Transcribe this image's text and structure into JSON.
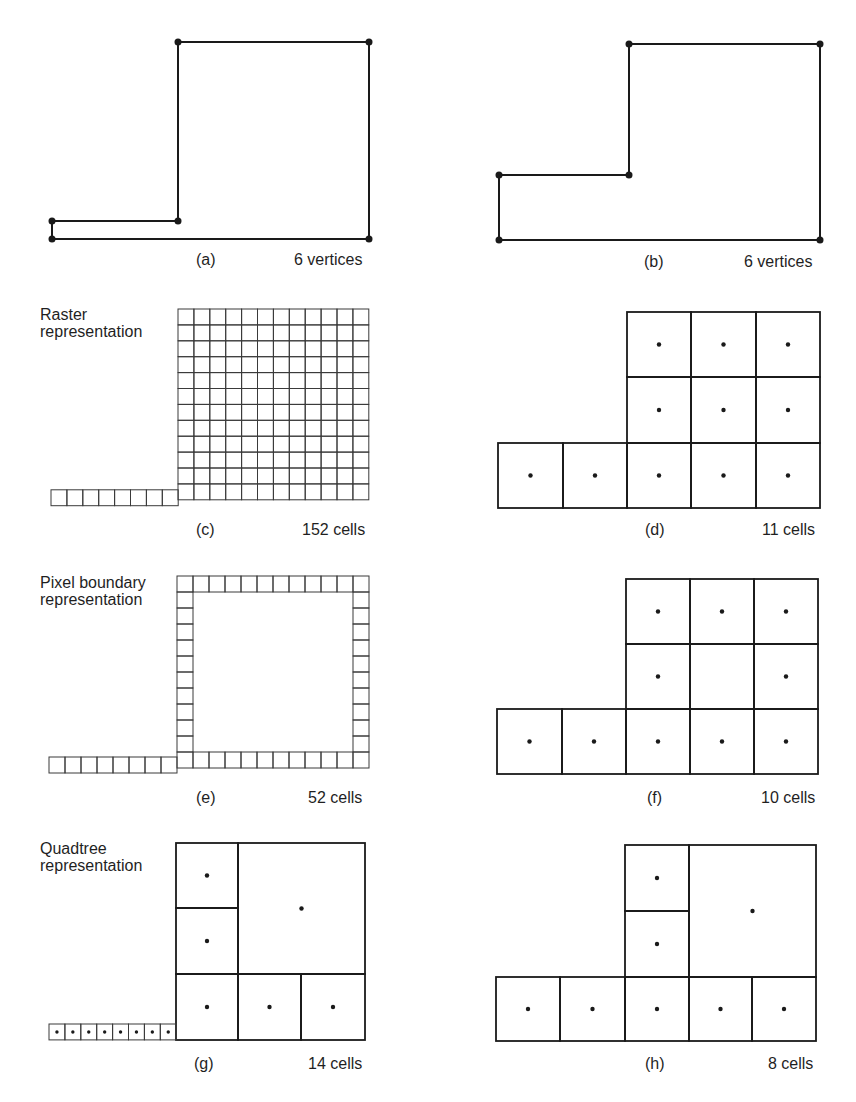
{
  "figure": {
    "panels": [
      {
        "id": "a",
        "caption": "(a)",
        "count_label": "6 vertices",
        "kind": "vector",
        "caption_pos": [
          196,
          252
        ],
        "count_pos": [
          294,
          252
        ],
        "vertices": [
          [
            52,
            221
          ],
          [
            178,
            221
          ],
          [
            178,
            42
          ],
          [
            369,
            42
          ],
          [
            369,
            239
          ],
          [
            52,
            239
          ]
        ]
      },
      {
        "id": "b",
        "caption": "(b)",
        "count_label": "6 vertices",
        "kind": "vector",
        "caption_pos": [
          644,
          254
        ],
        "count_pos": [
          744,
          254
        ],
        "vertices": [
          [
            499,
            175
          ],
          [
            629,
            175
          ],
          [
            629,
            44
          ],
          [
            820,
            44
          ],
          [
            820,
            240
          ],
          [
            499,
            240
          ]
        ]
      },
      {
        "id": "c",
        "caption": "(c)",
        "count_label": "152 cells",
        "kind": "raster",
        "side_label": [
          "Raster",
          "representation"
        ],
        "side_pos": [
          40,
          306
        ],
        "caption_pos": [
          196,
          522
        ],
        "count_pos": [
          302,
          522
        ],
        "grid": {
          "x0": 178,
          "y0": 309,
          "cols": 12,
          "rows": 12,
          "cell": 15.9
        },
        "tail": {
          "x0": 51,
          "y0": 489.8,
          "count": 8,
          "cell": 15.9
        }
      },
      {
        "id": "d",
        "caption": "(d)",
        "count_label": "11 cells",
        "kind": "coarse",
        "caption_pos": [
          645,
          522
        ],
        "count_pos": [
          762,
          522
        ],
        "cells": [
          [
            627,
            312,
            64,
            65,
            true
          ],
          [
            691,
            312,
            65,
            65,
            true
          ],
          [
            756,
            312,
            64,
            65,
            true
          ],
          [
            627,
            377,
            64,
            66,
            true
          ],
          [
            691,
            377,
            65,
            66,
            true
          ],
          [
            756,
            377,
            64,
            66,
            true
          ],
          [
            498,
            443,
            65,
            65,
            true
          ],
          [
            563,
            443,
            64,
            65,
            true
          ],
          [
            627,
            443,
            64,
            65,
            true
          ],
          [
            691,
            443,
            65,
            65,
            true
          ],
          [
            756,
            443,
            64,
            65,
            true
          ]
        ]
      },
      {
        "id": "e",
        "caption": "(e)",
        "count_label": "52 cells",
        "kind": "boundary",
        "side_label": [
          "Pixel boundary",
          "representation"
        ],
        "side_pos": [
          40,
          574
        ],
        "caption_pos": [
          196,
          790
        ],
        "count_pos": [
          308,
          790
        ],
        "grid": {
          "x0": 177,
          "y0": 576,
          "cols": 12,
          "rows": 12,
          "cell": 16
        },
        "tail": {
          "x0": 49,
          "y0": 757,
          "count": 8,
          "cell": 16
        }
      },
      {
        "id": "f",
        "caption": "(f)",
        "count_label": "10 cells",
        "kind": "coarse",
        "caption_pos": [
          647,
          790
        ],
        "count_pos": [
          761,
          790
        ],
        "cells": [
          [
            626,
            579,
            64,
            65,
            true
          ],
          [
            690,
            579,
            64,
            65,
            true
          ],
          [
            754,
            579,
            64,
            65,
            true
          ],
          [
            626,
            644,
            64,
            65,
            true
          ],
          [
            690,
            644,
            64,
            65,
            false
          ],
          [
            754,
            644,
            64,
            65,
            true
          ],
          [
            497,
            709,
            65,
            65,
            true
          ],
          [
            562,
            709,
            64,
            65,
            true
          ],
          [
            626,
            709,
            64,
            65,
            true
          ],
          [
            690,
            709,
            64,
            65,
            true
          ],
          [
            754,
            709,
            64,
            65,
            true
          ]
        ]
      },
      {
        "id": "g",
        "caption": "(g)",
        "count_label": "14 cells",
        "kind": "quadtree",
        "side_label": [
          "Quadtree",
          "representation"
        ],
        "side_pos": [
          40,
          840
        ],
        "caption_pos": [
          194,
          1056
        ],
        "count_pos": [
          308,
          1056
        ],
        "cells": [
          [
            176,
            843,
            62,
            65,
            true
          ],
          [
            176,
            908,
            62,
            66,
            true
          ],
          [
            238,
            843,
            127,
            131,
            true
          ],
          [
            176,
            974,
            62,
            66,
            true
          ],
          [
            238,
            974,
            63,
            66,
            true
          ],
          [
            301,
            974,
            64,
            66,
            true
          ]
        ],
        "tail": {
          "x0": 49,
          "y0": 1024,
          "count": 8,
          "cell": 15.9,
          "dots": true
        }
      },
      {
        "id": "h",
        "caption": "(h)",
        "count_label": "8 cells",
        "kind": "quadtree",
        "caption_pos": [
          645,
          1056
        ],
        "count_pos": [
          768,
          1056
        ],
        "cells": [
          [
            625,
            845,
            64,
            66,
            true
          ],
          [
            625,
            911,
            64,
            66,
            true
          ],
          [
            689,
            845,
            127,
            132,
            true
          ],
          [
            496,
            977,
            64,
            64,
            true
          ],
          [
            560,
            977,
            65,
            64,
            true
          ],
          [
            625,
            977,
            64,
            64,
            true
          ],
          [
            689,
            977,
            63,
            64,
            true
          ],
          [
            752,
            977,
            64,
            64,
            true
          ]
        ]
      }
    ],
    "colors": {
      "line": "#1a1a1a",
      "thin_line": "#3a3a3a",
      "background": "#ffffff"
    }
  }
}
